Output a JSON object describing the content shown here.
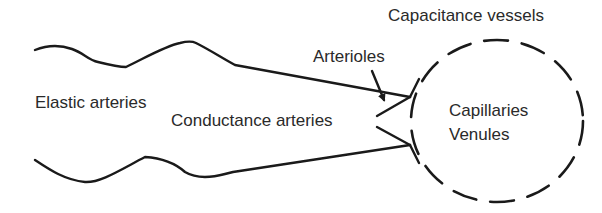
{
  "diagram": {
    "labels": {
      "elastic_arteries": "Elastic arteries",
      "conductance_arteries": "Conductance arteries",
      "arterioles": "Arterioles",
      "capacitance_vessels": "Capacitance vessels",
      "capillaries": "Capillaries",
      "venules": "Venules"
    },
    "colors": {
      "line": "#1a1a1a",
      "text": "#2a2a2a",
      "background": "#ffffff"
    }
  }
}
